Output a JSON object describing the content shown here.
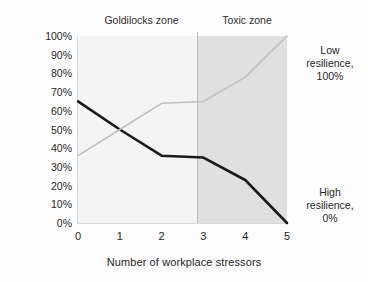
{
  "chart_data": {
    "type": "line",
    "title": "",
    "xlabel": "Number of workplace stressors",
    "ylabel": "Percentage of respondents",
    "x": [
      0,
      1,
      2,
      3,
      4,
      5
    ],
    "xticklabels": [
      "0",
      "1",
      "2",
      "3",
      "4",
      "5"
    ],
    "xlim": [
      0,
      5
    ],
    "ylim": [
      0,
      100
    ],
    "yticklabels": [
      "0%",
      "10%",
      "20%",
      "30%",
      "40%",
      "50%",
      "60%",
      "70%",
      "80%",
      "90%",
      "100%"
    ],
    "yticks": [
      0,
      10,
      20,
      30,
      40,
      50,
      60,
      70,
      80,
      90,
      100
    ],
    "grid": false,
    "legend_position": "right-annotations",
    "series": [
      {
        "name": "High resilience",
        "color": "#1a1a1a",
        "width": 2.6,
        "values": [
          65,
          50,
          36,
          35,
          23,
          0
        ]
      },
      {
        "name": "Low resilience",
        "color": "#bfbfbf",
        "width": 1.6,
        "values": [
          36,
          50,
          64,
          65,
          78,
          100
        ]
      }
    ],
    "zones": [
      {
        "name": "Goldilocks zone",
        "label": "Goldilocks zone",
        "x_start": 0,
        "x_end": 2.85,
        "color": "#f4f4f4"
      },
      {
        "name": "Toxic zone",
        "label": "Toxic zone",
        "x_start": 2.85,
        "x_end": 5,
        "color": "#e0e0e0"
      }
    ],
    "divider_x": 2.85,
    "annotations": [
      {
        "name": "low-resilience",
        "lines": [
          "Low",
          "resilience,",
          "100%"
        ]
      },
      {
        "name": "high-resilience",
        "lines": [
          "High",
          "resilience,",
          "0%"
        ]
      }
    ]
  }
}
